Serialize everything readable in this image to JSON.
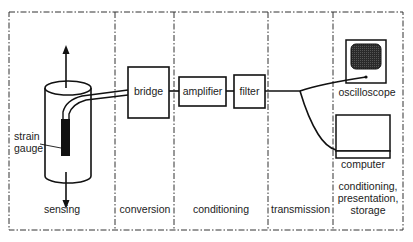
{
  "stages": [
    {
      "id": "sensing",
      "label": "sensing"
    },
    {
      "id": "conversion",
      "label": "conversion"
    },
    {
      "id": "conditioning",
      "label": "conditioning"
    },
    {
      "id": "transmission",
      "label": "transmission"
    },
    {
      "id": "output",
      "label_lines": [
        "conditioning,",
        "presentation,",
        "storage"
      ]
    }
  ],
  "components": {
    "strain_gauge": {
      "label_lines": [
        "strain",
        "gauge"
      ]
    },
    "bridge": {
      "label": "bridge"
    },
    "amplifier": {
      "label": "amplifier"
    },
    "filter": {
      "label": "filter"
    },
    "oscilloscope": {
      "label": "oscilloscope"
    },
    "computer": {
      "label": "computer"
    }
  },
  "icons": {
    "force_arrow_up": "arrow-up-icon",
    "force_arrow_down": "arrow-down-icon",
    "oscilloscope": "oscilloscope-icon",
    "computer": "computer-icon"
  },
  "colors": {
    "stroke": "#111111",
    "dashed_border": "#333333",
    "screen_fill": "#3a3a3a",
    "gauge_fill": "#111111"
  }
}
